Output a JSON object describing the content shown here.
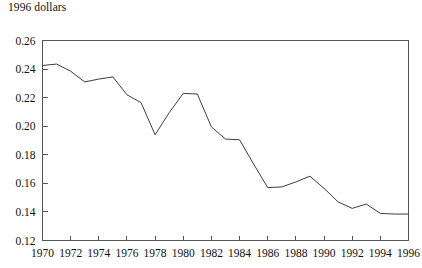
{
  "chart_data": {
    "type": "line",
    "title": "1996 dollars",
    "xlabel": "",
    "ylabel": "",
    "ylim": [
      0.12,
      0.26
    ],
    "xlim": [
      1970,
      1996
    ],
    "grid": false,
    "legend": false,
    "y_ticks": [
      "0.12",
      "0.14",
      "0.16",
      "0.18",
      "0.20",
      "0.22",
      "0.24",
      "0.26"
    ],
    "y_tick_values": [
      0.12,
      0.14,
      0.16,
      0.18,
      0.2,
      0.22,
      0.24,
      0.26
    ],
    "x_ticks": [
      "1970",
      "1972",
      "1974",
      "1976",
      "1978",
      "1980",
      "1982",
      "1984",
      "1986",
      "1988",
      "1990",
      "1992",
      "1994",
      "1996"
    ],
    "x_tick_values": [
      1970,
      1972,
      1974,
      1976,
      1978,
      1980,
      1982,
      1984,
      1986,
      1988,
      1990,
      1992,
      1994,
      1996
    ],
    "series": [
      {
        "name": "1996 dollars",
        "color": "#3d3d3d",
        "x": [
          1970,
          1971,
          1972,
          1973,
          1974,
          1975,
          1976,
          1977,
          1978,
          1979,
          1980,
          1981,
          1982,
          1983,
          1984,
          1985,
          1986,
          1987,
          1988,
          1989,
          1990,
          1991,
          1992,
          1993,
          1994,
          1995,
          1996
        ],
        "values": [
          0.2425,
          0.2435,
          0.2385,
          0.231,
          0.233,
          0.2345,
          0.222,
          0.2165,
          0.194,
          0.2095,
          0.223,
          0.2225,
          0.1995,
          0.191,
          0.1905,
          0.1735,
          0.157,
          0.1575,
          0.161,
          0.165,
          0.1565,
          0.147,
          0.1425,
          0.1455,
          0.139,
          0.1385,
          0.1385
        ]
      }
    ]
  }
}
